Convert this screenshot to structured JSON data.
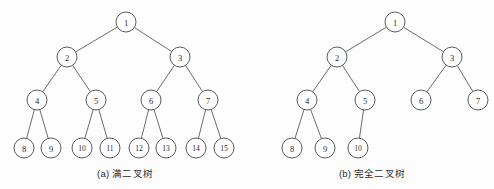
{
  "figure": {
    "background_color": "#fdfdfd",
    "node_stroke_color": "#4a4a4a",
    "edge_stroke_color": "#5b5b5b",
    "node_fill_color": "#ffffff",
    "text_color": "#2b2b2b",
    "node_radius": 10
  },
  "subfigures": [
    {
      "id": "a",
      "caption": "(a) 满二叉树",
      "caption_label": "(a)",
      "caption_text": "满二叉树",
      "tree": {
        "type": "full-binary-tree",
        "depth": 4,
        "node_count": 15,
        "nodes": [
          {
            "label": "1",
            "x": 126,
            "y": 22
          },
          {
            "label": "2",
            "x": 67,
            "y": 57
          },
          {
            "label": "3",
            "x": 180,
            "y": 57
          },
          {
            "label": "4",
            "x": 37,
            "y": 100
          },
          {
            "label": "5",
            "x": 96,
            "y": 100
          },
          {
            "label": "6",
            "x": 151,
            "y": 100
          },
          {
            "label": "7",
            "x": 208,
            "y": 100
          },
          {
            "label": "8",
            "x": 24,
            "y": 148
          },
          {
            "label": "9",
            "x": 51,
            "y": 148
          },
          {
            "label": "10",
            "x": 82,
            "y": 148
          },
          {
            "label": "11",
            "x": 110,
            "y": 148
          },
          {
            "label": "12",
            "x": 139,
            "y": 148
          },
          {
            "label": "13",
            "x": 166,
            "y": 148
          },
          {
            "label": "14",
            "x": 196,
            "y": 148
          },
          {
            "label": "15",
            "x": 224,
            "y": 148
          }
        ],
        "edges": [
          {
            "from": "1",
            "to": "2"
          },
          {
            "from": "1",
            "to": "3"
          },
          {
            "from": "2",
            "to": "4"
          },
          {
            "from": "2",
            "to": "5"
          },
          {
            "from": "3",
            "to": "6"
          },
          {
            "from": "3",
            "to": "7"
          },
          {
            "from": "4",
            "to": "8"
          },
          {
            "from": "4",
            "to": "9"
          },
          {
            "from": "5",
            "to": "10"
          },
          {
            "from": "5",
            "to": "11"
          },
          {
            "from": "6",
            "to": "12"
          },
          {
            "from": "6",
            "to": "13"
          },
          {
            "from": "7",
            "to": "14"
          },
          {
            "from": "7",
            "to": "15"
          }
        ]
      }
    },
    {
      "id": "b",
      "caption": "(b) 完全二叉树",
      "caption_label": "(b)",
      "caption_text": "完全二叉树",
      "tree": {
        "type": "complete-binary-tree",
        "depth": 4,
        "node_count": 10,
        "nodes": [
          {
            "label": "1",
            "x": 395,
            "y": 22
          },
          {
            "label": "2",
            "x": 337,
            "y": 57
          },
          {
            "label": "3",
            "x": 452,
            "y": 57
          },
          {
            "label": "4",
            "x": 307,
            "y": 100
          },
          {
            "label": "5",
            "x": 365,
            "y": 100
          },
          {
            "label": "6",
            "x": 421,
            "y": 100
          },
          {
            "label": "7",
            "x": 478,
            "y": 100
          },
          {
            "label": "8",
            "x": 292,
            "y": 148
          },
          {
            "label": "9",
            "x": 325,
            "y": 148
          },
          {
            "label": "10",
            "x": 358,
            "y": 148
          }
        ],
        "edges": [
          {
            "from": "1",
            "to": "2"
          },
          {
            "from": "1",
            "to": "3"
          },
          {
            "from": "2",
            "to": "4"
          },
          {
            "from": "2",
            "to": "5"
          },
          {
            "from": "3",
            "to": "6"
          },
          {
            "from": "3",
            "to": "7"
          },
          {
            "from": "4",
            "to": "8"
          },
          {
            "from": "4",
            "to": "9"
          },
          {
            "from": "5",
            "to": "10"
          }
        ]
      }
    }
  ]
}
